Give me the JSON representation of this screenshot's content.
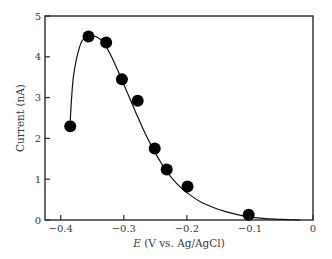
{
  "chart_data": {
    "type": "scatter",
    "title": "",
    "xlabel": "E (V vs. Ag/AgCl)",
    "xlabel_italic_part": "E",
    "xlabel_rest": " (V vs. Ag/AgCl)",
    "ylabel": "Current (nA)",
    "xlim": [
      -0.425,
      0
    ],
    "ylim": [
      0,
      5
    ],
    "xticks": [
      -0.4,
      -0.3,
      -0.2,
      -0.1,
      0
    ],
    "xtick_labels": [
      "−0.4",
      "−0.3",
      "−0.2",
      "−0.1",
      "0"
    ],
    "yticks": [
      0,
      1,
      2,
      3,
      4,
      5
    ],
    "ytick_labels": [
      "0",
      "1",
      "2",
      "3",
      "4",
      "5"
    ],
    "grid": false,
    "legend": null,
    "series": [
      {
        "name": "measured",
        "marker": "filled-circle",
        "color": "#000000",
        "x": [
          -0.385,
          -0.356,
          -0.328,
          -0.303,
          -0.278,
          -0.251,
          -0.232,
          -0.199,
          -0.102
        ],
        "y": [
          2.3,
          4.5,
          4.35,
          3.45,
          2.92,
          1.75,
          1.24,
          0.82,
          0.13
        ]
      },
      {
        "name": "fit",
        "style": "line",
        "color": "#000000",
        "x": [
          -0.385,
          -0.38,
          -0.37,
          -0.36,
          -0.35,
          -0.34,
          -0.33,
          -0.32,
          -0.31,
          -0.3,
          -0.29,
          -0.28,
          -0.27,
          -0.26,
          -0.25,
          -0.24,
          -0.23,
          -0.22,
          -0.21,
          -0.2,
          -0.18,
          -0.16,
          -0.14,
          -0.12,
          -0.1,
          -0.08,
          -0.06,
          -0.04,
          -0.02
        ],
        "y": [
          2.45,
          3.5,
          4.25,
          4.5,
          4.52,
          4.46,
          4.3,
          4.02,
          3.68,
          3.32,
          2.96,
          2.6,
          2.25,
          1.93,
          1.64,
          1.38,
          1.15,
          0.96,
          0.8,
          0.67,
          0.46,
          0.32,
          0.21,
          0.13,
          0.07,
          0.04,
          0.02,
          0.01,
          0.0
        ]
      }
    ]
  }
}
